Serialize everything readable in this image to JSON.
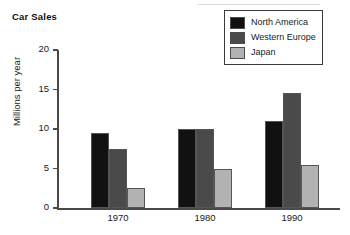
{
  "chart_data": {
    "type": "bar",
    "title": "Car Sales",
    "xlabel": "",
    "ylabel": "Millions per year",
    "categories": [
      "1970",
      "1980",
      "1990"
    ],
    "series": [
      {
        "name": "North America",
        "values": [
          9.5,
          10.0,
          11.0
        ],
        "color": "#111111"
      },
      {
        "name": "Western Europe",
        "values": [
          7.5,
          10.0,
          14.5
        ],
        "color": "#4a4a4a"
      },
      {
        "name": "Japan",
        "values": [
          2.5,
          5.0,
          5.5
        ],
        "color": "#b2b2b2"
      }
    ],
    "ylim": [
      0,
      20
    ],
    "yticks": [
      "0",
      "5",
      "10",
      "15",
      "20"
    ],
    "grid": false,
    "legend_position": "top-right"
  }
}
